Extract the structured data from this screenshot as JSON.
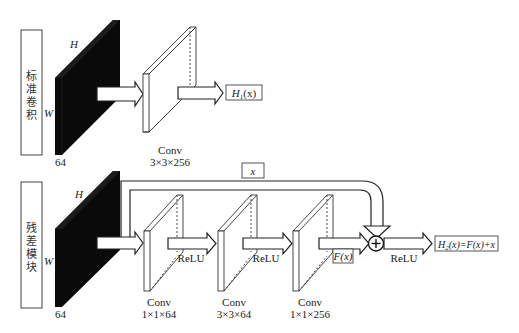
{
  "colors": {
    "background": "#ffffff",
    "stroke": "#222222",
    "slab_fill": "#0a0a0a",
    "text": "#222222"
  },
  "standard_conv": {
    "side_label_chars": [
      "标",
      "准",
      "卷",
      "积"
    ],
    "input": {
      "h_label": "H",
      "w_label": "W",
      "depth_label": "64"
    },
    "conv": {
      "name": "Conv",
      "kernel": "3×3×256"
    },
    "output_label_main": "H",
    "output_label_sub": "1",
    "output_label_tail": "(x)"
  },
  "residual_block": {
    "side_label_chars": [
      "残",
      "差",
      "模",
      "块"
    ],
    "input": {
      "h_label": "H",
      "w_label": "W",
      "depth_label": "64"
    },
    "skip_label": "x",
    "convs": [
      {
        "name": "Conv",
        "kernel": "1×1×64"
      },
      {
        "name": "Conv",
        "kernel": "3×3×64"
      },
      {
        "name": "Conv",
        "kernel": "1×1×256"
      }
    ],
    "activations": [
      "ReLU",
      "ReLU",
      "ReLU"
    ],
    "residual_label": "F(x)",
    "add_symbol": "+",
    "output_label_main": "H",
    "output_label_sub": "2",
    "output_label_tail": "(x)=F(x)+x"
  }
}
